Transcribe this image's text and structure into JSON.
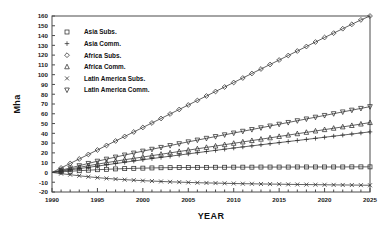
{
  "chart_data": {
    "type": "line",
    "title": "",
    "xlabel": "YEAR",
    "ylabel": "Mha",
    "xlim": [
      1990,
      2025
    ],
    "ylim": [
      -20,
      160
    ],
    "xticks": [
      1990,
      1995,
      2000,
      2005,
      2010,
      2015,
      2020,
      2025
    ],
    "yticks": [
      -20,
      -10,
      0,
      10,
      20,
      30,
      40,
      50,
      60,
      70,
      80,
      90,
      100,
      110,
      120,
      130,
      140,
      150,
      160
    ],
    "grid": false,
    "legend_position": "upper-left-inside",
    "x": [
      1990,
      1991,
      1992,
      1993,
      1994,
      1995,
      1996,
      1997,
      1998,
      1999,
      2000,
      2001,
      2002,
      2003,
      2004,
      2005,
      2006,
      2007,
      2008,
      2009,
      2010,
      2011,
      2012,
      2013,
      2014,
      2015,
      2016,
      2017,
      2018,
      2019,
      2020,
      2021,
      2022,
      2023,
      2024,
      2025
    ],
    "series": [
      {
        "name": "Asia Subs.",
        "marker": "square",
        "values": [
          0,
          0.6,
          1.2,
          1.8,
          2.3,
          2.8,
          3.2,
          3.6,
          3.9,
          4.2,
          4.4,
          4.6,
          4.8,
          4.9,
          5.0,
          5.1,
          5.2,
          5.2,
          5.3,
          5.3,
          5.4,
          5.4,
          5.4,
          5.5,
          5.5,
          5.5,
          5.5,
          5.6,
          5.6,
          5.6,
          5.6,
          5.6,
          5.6,
          5.7,
          5.7,
          5.7
        ]
      },
      {
        "name": "Asia Comm.",
        "marker": "plus",
        "values": [
          0,
          1.3,
          2.6,
          3.9,
          5.2,
          6.5,
          7.8,
          9.1,
          10.4,
          11.7,
          13.0,
          14.2,
          15.4,
          16.6,
          17.8,
          19.0,
          20.2,
          21.4,
          22.6,
          23.8,
          25.0,
          26.1,
          27.2,
          28.3,
          29.4,
          30.5,
          31.6,
          32.7,
          33.8,
          34.9,
          36.0,
          37.1,
          38.2,
          39.3,
          40.4,
          41.5
        ]
      },
      {
        "name": "Africa Subs.",
        "marker": "diamond",
        "values": [
          0,
          4.6,
          9.2,
          13.8,
          18.4,
          23.0,
          27.6,
          32.2,
          36.8,
          41.4,
          46.0,
          50.6,
          55.2,
          59.8,
          64.4,
          69.0,
          73.6,
          78.2,
          82.8,
          87.4,
          92.0,
          96.6,
          101.2,
          105.8,
          110.4,
          115.0,
          119.6,
          124.2,
          128.8,
          133.4,
          138.0,
          142.5,
          147.0,
          151.5,
          156.0,
          160.0
        ]
      },
      {
        "name": "Africa Comm.",
        "marker": "triangle",
        "values": [
          0,
          1.8,
          3.5,
          5.2,
          6.9,
          8.5,
          10.0,
          11.5,
          13.0,
          14.4,
          15.8,
          17.2,
          18.6,
          20.0,
          21.4,
          22.8,
          24.2,
          25.6,
          27.0,
          28.4,
          29.8,
          31.2,
          32.6,
          34.0,
          35.4,
          36.8,
          38.2,
          39.6,
          41.0,
          42.4,
          43.8,
          45.2,
          46.6,
          48.0,
          49.5,
          51.0
        ]
      },
      {
        "name": "Latin America Subs.",
        "marker": "cross",
        "values": [
          0,
          -1.2,
          -2.3,
          -3.4,
          -4.4,
          -5.3,
          -6.1,
          -6.8,
          -7.4,
          -7.9,
          -8.4,
          -8.8,
          -9.2,
          -9.6,
          -9.9,
          -10.2,
          -10.5,
          -10.7,
          -10.9,
          -11.1,
          -11.3,
          -11.5,
          -11.6,
          -11.8,
          -11.9,
          -12.0,
          -12.2,
          -12.3,
          -12.4,
          -12.5,
          -12.6,
          -12.7,
          -12.8,
          -12.9,
          -13.0,
          -13.1
        ]
      },
      {
        "name": "Latin America Comm.",
        "marker": "triangle-down",
        "values": [
          0,
          2.3,
          4.6,
          6.9,
          9.2,
          11.5,
          13.6,
          15.7,
          17.8,
          19.8,
          21.8,
          23.7,
          25.6,
          27.5,
          29.4,
          31.3,
          33.1,
          34.9,
          36.7,
          38.5,
          40.3,
          42.1,
          43.9,
          45.7,
          47.5,
          49.3,
          51.1,
          52.9,
          54.7,
          56.5,
          58.3,
          60.1,
          61.9,
          63.7,
          65.5,
          67.3
        ]
      }
    ]
  },
  "legend": {
    "items": [
      {
        "label": "Asia Subs.",
        "marker": "square"
      },
      {
        "label": "Asia Comm.",
        "marker": "plus"
      },
      {
        "label": "Africa Subs.",
        "marker": "diamond"
      },
      {
        "label": "Africa Comm.",
        "marker": "triangle"
      },
      {
        "label": "Latin America Subs.",
        "marker": "cross"
      },
      {
        "label": "Latin America Comm.",
        "marker": "triangle-down"
      }
    ]
  },
  "colors": {
    "line": "#3b3b3b",
    "axis": "#4a4a4a",
    "text": "#111111",
    "background": "#ffffff"
  }
}
